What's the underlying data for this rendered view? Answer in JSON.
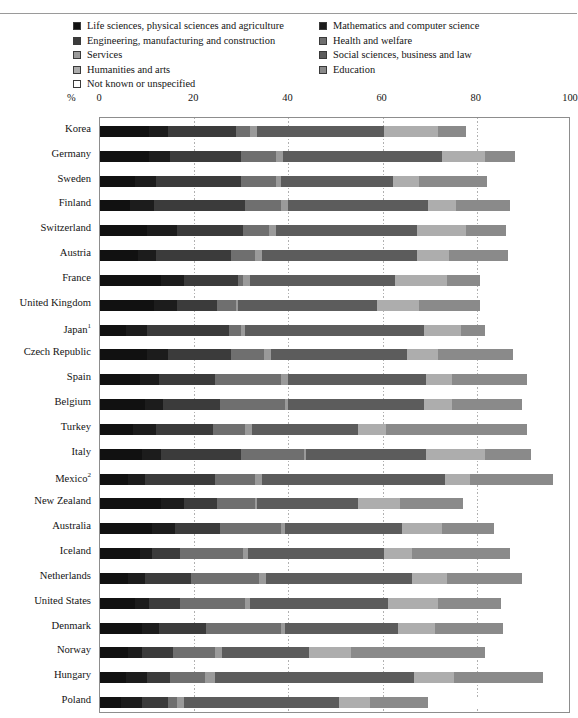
{
  "page": {
    "clipped_title": "",
    "percent_symbol": "%"
  },
  "legend": {
    "left_column": [
      {
        "label": "Life sciences, physical sciences and agriculture",
        "color": "#111111",
        "name": "legend-swatch-life-sciences"
      },
      {
        "label": "Engineering, manufacturing and construction",
        "color": "#3b3b3b",
        "name": "legend-swatch-engineering"
      },
      {
        "label": "Services",
        "color": "#9a9a9a",
        "name": "legend-swatch-services"
      },
      {
        "label": "Humanities and arts",
        "color": "#adadad",
        "name": "legend-swatch-humanities"
      },
      {
        "label": "Not known or unspecified",
        "color": "#ffffff",
        "name": "legend-swatch-not-known"
      }
    ],
    "right_column": [
      {
        "label": "Mathematics and computer science",
        "color": "#1c1c1c",
        "name": "legend-swatch-mathematics"
      },
      {
        "label": "Health and welfare",
        "color": "#6f6f6f",
        "name": "legend-swatch-health"
      },
      {
        "label": "Social sciences, business and law",
        "color": "#5c5c5c",
        "name": "legend-swatch-social-sciences"
      },
      {
        "label": "Education",
        "color": "#8a8a8a",
        "name": "legend-swatch-education"
      }
    ]
  },
  "axis": {
    "ticks": [
      0,
      20,
      40,
      60,
      80,
      100
    ],
    "min": 0,
    "max": 100,
    "unit": "%"
  },
  "chart_data": {
    "type": "bar",
    "orientation": "horizontal",
    "stacked": true,
    "normalized": true,
    "title": "",
    "xlabel": "%",
    "ylabel": "",
    "xlim": [
      0,
      100
    ],
    "grid": true,
    "legend_position": "top",
    "series": [
      {
        "name": "Life sciences, physical sciences and agriculture",
        "color": "#111111"
      },
      {
        "name": "Mathematics and computer science",
        "color": "#1c1c1c"
      },
      {
        "name": "Engineering, manufacturing and construction",
        "color": "#3b3b3b"
      },
      {
        "name": "Health and welfare",
        "color": "#6f6f6f"
      },
      {
        "name": "Services",
        "color": "#9a9a9a"
      },
      {
        "name": "Social sciences, business and law",
        "color": "#5c5c5c"
      },
      {
        "name": "Humanities and arts",
        "color": "#adadad"
      },
      {
        "name": "Education",
        "color": "#8a8a8a"
      },
      {
        "name": "Not known or unspecified",
        "color": "#ffffff"
      }
    ],
    "categories": [
      "Korea",
      "Germany",
      "Sweden",
      "Finland",
      "Switzerland",
      "Austria",
      "France",
      "United Kingdom",
      "Japan",
      "Czech Republic",
      "Spain",
      "Belgium",
      "Turkey",
      "Italy",
      "Mexico",
      "New Zealand",
      "Australia",
      "Iceland",
      "Netherlands",
      "United States",
      "Denmark",
      "Norway",
      "Hungary",
      "Poland"
    ],
    "rows": [
      {
        "category": "Korea",
        "label": "Korea",
        "footnote": "",
        "values": [
          10.5,
          4.0,
          14.5,
          3.0,
          1.5,
          27.0,
          11.5,
          6.0,
          0.0
        ]
      },
      {
        "category": "Germany",
        "label": "Germany",
        "footnote": "",
        "values": [
          10.5,
          4.5,
          15.0,
          7.5,
          1.5,
          34.0,
          9.0,
          6.5,
          0.0
        ]
      },
      {
        "category": "Sweden",
        "label": "Sweden",
        "footnote": "",
        "values": [
          7.5,
          4.5,
          18.0,
          7.5,
          1.0,
          24.0,
          5.5,
          14.5,
          0.0
        ]
      },
      {
        "category": "Finland",
        "label": "Finland",
        "footnote": "",
        "values": [
          6.5,
          5.0,
          19.5,
          7.5,
          1.5,
          30.0,
          6.0,
          11.5,
          0.0
        ]
      },
      {
        "category": "Switzerland",
        "label": "Switzerland",
        "footnote": "",
        "values": [
          10.0,
          6.5,
          14.0,
          5.5,
          1.5,
          30.0,
          10.5,
          8.5,
          0.0
        ]
      },
      {
        "category": "Austria",
        "label": "Austria",
        "footnote": "",
        "values": [
          8.0,
          4.0,
          16.0,
          5.0,
          1.5,
          33.0,
          7.0,
          12.5,
          0.0
        ]
      },
      {
        "category": "France",
        "label": "France",
        "footnote": "",
        "values": [
          13.0,
          5.0,
          11.5,
          1.0,
          1.5,
          31.0,
          11.0,
          7.0,
          0.0
        ]
      },
      {
        "category": "United Kingdom",
        "label": "United Kingdom",
        "footnote": "",
        "values": [
          11.5,
          5.0,
          8.5,
          4.0,
          0.5,
          29.5,
          9.0,
          13.0,
          0.0
        ]
      },
      {
        "category": "Japan",
        "label": "Japan",
        "footnote": "1",
        "values": [
          5.5,
          4.5,
          17.5,
          2.5,
          1.0,
          38.0,
          8.0,
          5.0,
          2.0
        ]
      },
      {
        "category": "Czech Republic",
        "label": "Czech Republic",
        "footnote": "",
        "values": [
          10.0,
          4.5,
          13.5,
          7.0,
          1.5,
          29.0,
          6.5,
          16.0,
          2.5
        ]
      },
      {
        "category": "Spain",
        "label": "Spain",
        "footnote": "",
        "values": [
          8.5,
          4.0,
          12.0,
          14.0,
          1.5,
          29.5,
          5.5,
          16.0,
          0.0
        ]
      },
      {
        "category": "Belgium",
        "label": "Belgium",
        "footnote": "",
        "values": [
          9.5,
          4.0,
          12.0,
          14.0,
          0.5,
          29.0,
          6.0,
          15.0,
          1.5
        ]
      },
      {
        "category": "Turkey",
        "label": "Turkey",
        "footnote": "",
        "values": [
          7.0,
          5.0,
          12.0,
          7.0,
          1.5,
          22.5,
          6.0,
          30.0,
          1.5
        ]
      },
      {
        "category": "Italy",
        "label": "Italy",
        "footnote": "",
        "values": [
          9.0,
          4.0,
          17.0,
          13.5,
          0.5,
          25.5,
          12.5,
          10.0,
          0.0
        ]
      },
      {
        "category": "Mexico",
        "label": "Mexico",
        "footnote": "2",
        "values": [
          6.0,
          3.5,
          15.0,
          8.5,
          1.5,
          39.0,
          5.5,
          17.5,
          0.0
        ]
      },
      {
        "category": "New Zealand",
        "label": "New Zealand",
        "footnote": "",
        "values": [
          13.0,
          5.0,
          7.0,
          8.0,
          0.5,
          21.5,
          9.0,
          13.5,
          0.0
        ]
      },
      {
        "category": "Australia",
        "label": "Australia",
        "footnote": "",
        "values": [
          11.0,
          5.0,
          9.5,
          13.0,
          1.0,
          25.0,
          8.5,
          11.0,
          0.0
        ]
      },
      {
        "category": "Iceland",
        "label": "Iceland",
        "footnote": "",
        "values": [
          8.5,
          2.5,
          6.0,
          13.5,
          1.0,
          29.0,
          6.0,
          21.0,
          0.0
        ]
      },
      {
        "category": "Netherlands",
        "label": "Netherlands",
        "footnote": "",
        "values": [
          6.0,
          3.5,
          10.0,
          14.5,
          1.5,
          31.0,
          7.5,
          16.0,
          0.0
        ]
      },
      {
        "category": "United States",
        "label": "United States",
        "footnote": "",
        "values": [
          7.5,
          3.0,
          6.5,
          14.0,
          1.0,
          29.5,
          10.5,
          13.5,
          0.0
        ]
      },
      {
        "category": "Denmark",
        "label": "Denmark",
        "footnote": "",
        "values": [
          9.0,
          3.5,
          10.0,
          16.0,
          1.0,
          24.0,
          8.0,
          14.5,
          0.0
        ]
      },
      {
        "category": "Norway",
        "label": "Norway",
        "footnote": "",
        "values": [
          6.0,
          3.0,
          6.5,
          9.0,
          1.5,
          18.5,
          9.0,
          28.5,
          1.5
        ]
      },
      {
        "category": "Hungary",
        "label": "Hungary",
        "footnote": "",
        "values": [
          5.5,
          4.5,
          5.0,
          7.5,
          2.0,
          42.5,
          8.5,
          19.0,
          0.0
        ]
      },
      {
        "category": "Poland",
        "label": "Poland",
        "footnote": "",
        "values": [
          4.5,
          4.5,
          5.5,
          2.0,
          1.5,
          33.0,
          6.5,
          12.5,
          26.0
        ]
      }
    ]
  }
}
